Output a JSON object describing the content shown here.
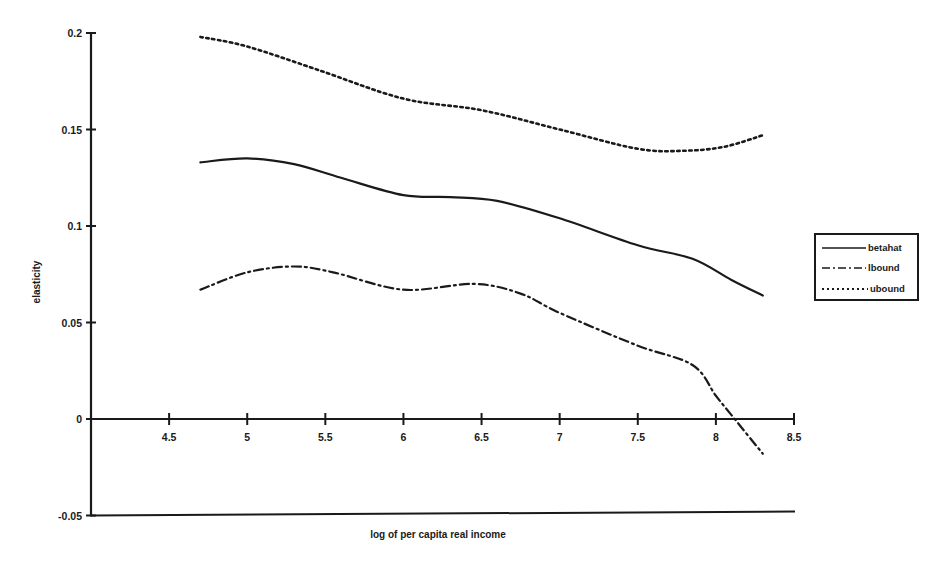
{
  "chart_data": {
    "type": "line",
    "title": "",
    "xlabel": "log of per capita real income",
    "ylabel": "elasticity",
    "xlim": [
      4.0,
      8.5
    ],
    "ylim": [
      -0.05,
      0.2
    ],
    "x_ticks": [
      4.5,
      5,
      5.5,
      6,
      6.5,
      7,
      7.5,
      8,
      8.5
    ],
    "x_tick_labels": [
      "4.5",
      "5",
      "5.5",
      "6",
      "6.5",
      "7",
      "7.5",
      "8",
      "8.5"
    ],
    "y_ticks": [
      -0.05,
      0,
      0.05,
      0.1,
      0.15,
      0.2
    ],
    "y_tick_labels": [
      "-0.05",
      "0",
      "0.05",
      "0.1",
      "0.15",
      "0.2"
    ],
    "grid": false,
    "legend_position": "right",
    "series": [
      {
        "name": "betahat",
        "style": "solid",
        "x": [
          4.7,
          5.0,
          5.3,
          5.6,
          6.0,
          6.3,
          6.6,
          7.0,
          7.5,
          7.85,
          8.1,
          8.3
        ],
        "y": [
          0.133,
          0.135,
          0.132,
          0.125,
          0.116,
          0.115,
          0.113,
          0.104,
          0.09,
          0.083,
          0.072,
          0.064
        ]
      },
      {
        "name": "lbound",
        "style": "dash-dot",
        "x": [
          4.7,
          5.0,
          5.3,
          5.55,
          6.0,
          6.45,
          6.75,
          7.0,
          7.5,
          7.85,
          8.0,
          8.1,
          8.3
        ],
        "y": [
          0.067,
          0.076,
          0.079,
          0.076,
          0.067,
          0.07,
          0.065,
          0.055,
          0.038,
          0.028,
          0.012,
          0.002,
          -0.018
        ]
      },
      {
        "name": "ubound",
        "style": "dotted",
        "x": [
          4.7,
          5.0,
          5.45,
          6.0,
          6.5,
          7.0,
          7.5,
          7.8,
          8.05,
          8.3
        ],
        "y": [
          0.198,
          0.193,
          0.181,
          0.166,
          0.16,
          0.15,
          0.14,
          0.139,
          0.141,
          0.147
        ]
      }
    ]
  },
  "legend": {
    "items": [
      {
        "label": "betahat",
        "style": "solid"
      },
      {
        "label": "lbound",
        "style": "dash-dot"
      },
      {
        "label": "ubound",
        "style": "dotted"
      }
    ]
  },
  "colors": {
    "ink": "#1a1a1a",
    "background": "#ffffff"
  }
}
